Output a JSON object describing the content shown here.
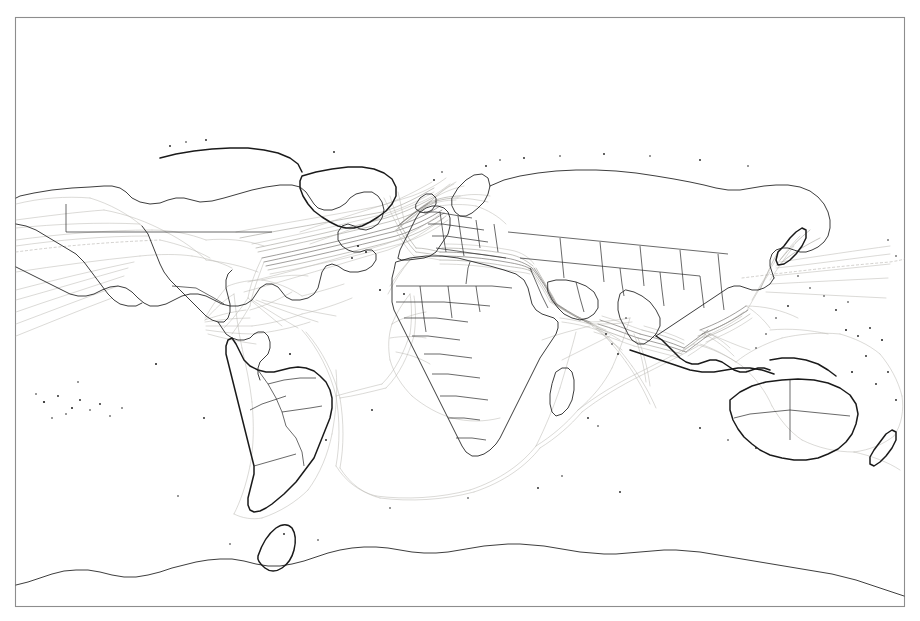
{
  "figure": {
    "kind": "world-map",
    "title": "",
    "projection": "equirectangular",
    "background_color": "#ffffff",
    "frame_color": "#8d8d8d",
    "coastline_color": "#1a1a1a",
    "border_color": "#2a2a2a",
    "route_color_light": "#b9b7b2",
    "route_color_medium": "#9a9892",
    "route_color_heavy": "#6f6d69",
    "frame": {
      "x": 15,
      "y": 17,
      "width": 890,
      "height": 590
    },
    "lon_range": [
      -180,
      180
    ],
    "lat_range": [
      -90,
      90
    ]
  },
  "chart_data": {
    "type": "map",
    "title": "",
    "xlabel": "",
    "ylabel": "",
    "grid": false,
    "legend": "none",
    "axis_ranges": {
      "longitude": [
        -180,
        180
      ],
      "latitude": [
        -90,
        90
      ]
    },
    "route_corridors": [
      {
        "name": "North Atlantic (US East Coast - Northwest Europe)",
        "density": "heavy"
      },
      {
        "name": "Mediterranean - Suez Canal",
        "density": "heavy"
      },
      {
        "name": "Red Sea - Gulf of Aden",
        "density": "heavy"
      },
      {
        "name": "Arabian Sea - Strait of Hormuz",
        "density": "medium"
      },
      {
        "name": "Strait of Malacca - Singapore",
        "density": "heavy"
      },
      {
        "name": "South China Sea - East Asia",
        "density": "heavy"
      },
      {
        "name": "Trans-Pacific (East Asia - North America)",
        "density": "medium"
      },
      {
        "name": "Panama Canal - Caribbean",
        "density": "medium"
      },
      {
        "name": "Cape of Good Hope",
        "density": "light"
      },
      {
        "name": "South Atlantic (Brazil - West Africa)",
        "density": "light"
      },
      {
        "name": "Australia - Southeast Asia",
        "density": "light"
      },
      {
        "name": "Indian Ocean cross-basin",
        "density": "light"
      }
    ]
  },
  "labels": {
    "none_visible": ""
  }
}
